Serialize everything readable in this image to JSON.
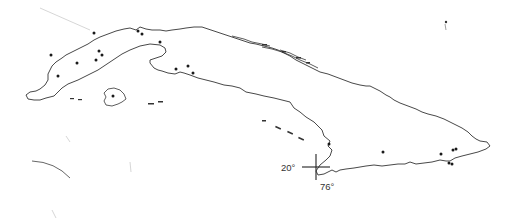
{
  "map": {
    "subject": "Cuba",
    "style": "black-and-white outline map with locality dots",
    "graticule_marker": {
      "latitude_label": "20°",
      "longitude_label": "76°",
      "x": 316,
      "y": 167
    },
    "colors": {
      "background": "#ffffff",
      "coastline": "#333333",
      "points": "#1a1a1a"
    },
    "localities": [
      {
        "x": 51,
        "y": 55
      },
      {
        "x": 58,
        "y": 76
      },
      {
        "x": 77,
        "y": 63
      },
      {
        "x": 94,
        "y": 33
      },
      {
        "x": 96,
        "y": 60
      },
      {
        "x": 99,
        "y": 51
      },
      {
        "x": 102,
        "y": 55
      },
      {
        "x": 138,
        "y": 31
      },
      {
        "x": 139,
        "y": 29
      },
      {
        "x": 142,
        "y": 34
      },
      {
        "x": 160,
        "y": 42
      },
      {
        "x": 176,
        "y": 69
      },
      {
        "x": 179,
        "y": 71
      },
      {
        "x": 188,
        "y": 66
      },
      {
        "x": 193,
        "y": 73
      },
      {
        "x": 113,
        "y": 96
      },
      {
        "x": 329,
        "y": 144
      },
      {
        "x": 383,
        "y": 152
      },
      {
        "x": 441,
        "y": 154
      },
      {
        "x": 453,
        "y": 150
      },
      {
        "x": 456,
        "y": 149
      },
      {
        "x": 449,
        "y": 163
      },
      {
        "x": 452,
        "y": 164
      }
    ]
  }
}
